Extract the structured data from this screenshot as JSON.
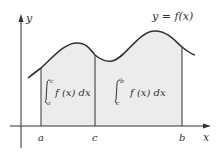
{
  "figure": {
    "curve_label": "y = f(x)",
    "y_axis_label": "y",
    "x_axis_label": "x",
    "points": {
      "a": "a",
      "c": "c",
      "b": "b"
    },
    "integral_left": {
      "lower": "a",
      "upper": "c",
      "integrand": "f (x) dx"
    },
    "integral_right": {
      "lower": "c",
      "upper": "b",
      "integrand": "f (x) dx"
    },
    "colors": {
      "fill": "#ececec",
      "stroke": "#333333"
    }
  }
}
